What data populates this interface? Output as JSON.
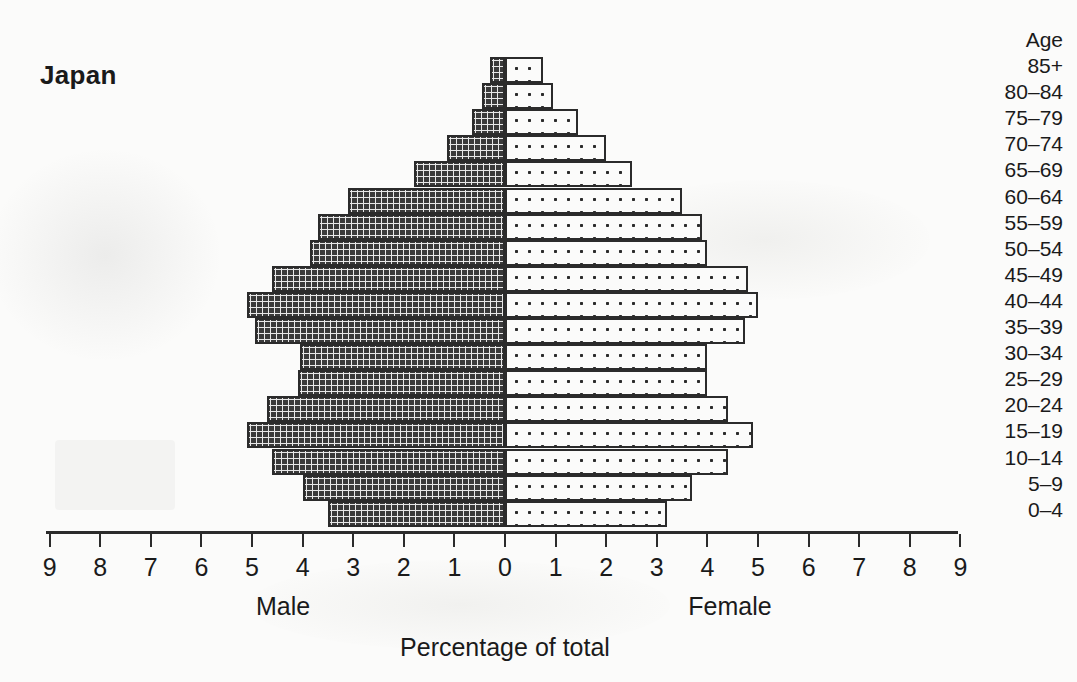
{
  "chart_data": {
    "type": "bar",
    "subtype": "population-pyramid",
    "title": "Japan",
    "xlabel": "Percentage of total",
    "ylabel": "Age",
    "left_label": "Male",
    "right_label": "Female",
    "grid": false,
    "legend_position": "below-axis",
    "xlim": [
      -9,
      9
    ],
    "xticks": [
      9,
      8,
      7,
      6,
      5,
      4,
      3,
      2,
      1,
      0,
      1,
      2,
      3,
      4,
      5,
      6,
      7,
      8,
      9
    ],
    "xtick_labels": [
      "9",
      "8",
      "7",
      "6",
      "5",
      "4",
      "3",
      "2",
      "1",
      "0",
      "1",
      "2",
      "3",
      "4",
      "5",
      "6",
      "7",
      "8",
      "9"
    ],
    "categories": [
      "85+",
      "80–84",
      "75–79",
      "70–74",
      "65–69",
      "60–64",
      "55–59",
      "50–54",
      "45–49",
      "40–44",
      "35–39",
      "30–34",
      "25–29",
      "20–24",
      "15–19",
      "10–14",
      "5–9",
      "0–4"
    ],
    "series": [
      {
        "name": "Male",
        "side": "left",
        "fill": "dark-grid-hatch",
        "values": [
          0.3,
          0.45,
          0.65,
          1.15,
          1.8,
          3.1,
          3.7,
          3.85,
          4.6,
          5.1,
          4.95,
          4.05,
          4.1,
          4.7,
          5.1,
          4.6,
          4.0,
          3.5
        ]
      },
      {
        "name": "Female",
        "side": "right",
        "fill": "sparse-dot",
        "values": [
          0.75,
          0.95,
          1.45,
          2.0,
          2.5,
          3.5,
          3.9,
          4.0,
          4.8,
          5.0,
          4.75,
          4.0,
          4.0,
          4.4,
          4.9,
          4.4,
          3.7,
          3.2
        ]
      }
    ]
  },
  "colors": {
    "ink": "#2b2b2b",
    "background": "#fbfbfa",
    "male_fill": "#3a3a3a",
    "female_fill": "#fbfbfa"
  },
  "age_header": "Age"
}
